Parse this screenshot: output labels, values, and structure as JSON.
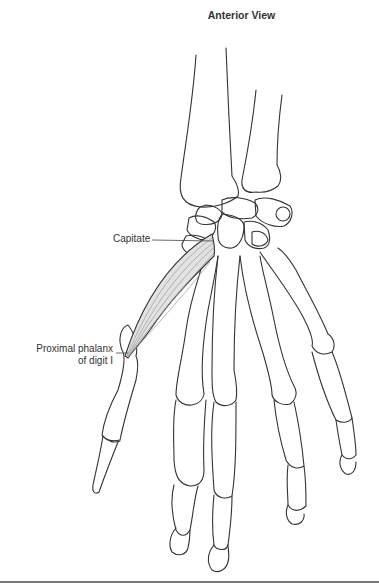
{
  "figure": {
    "title": "Anterior View",
    "labels": [
      {
        "id": "capitate",
        "text": "Capitate"
      },
      {
        "id": "proximal-phalanx",
        "line1": "Proximal phalanx",
        "line2": "of digit I"
      }
    ],
    "colors": {
      "outline": "#333333",
      "muscle_fill": "#e2e2e2",
      "muscle_fiber": "#9a9a9a",
      "leader_line": "#444444",
      "rule": "#777777"
    }
  }
}
